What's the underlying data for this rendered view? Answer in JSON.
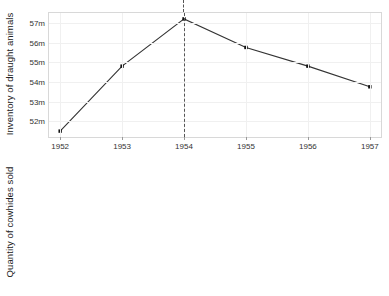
{
  "chart_data": [
    {
      "type": "line",
      "panel": "top",
      "title": "",
      "xlabel": "",
      "ylabel": "Inventory of draught animals",
      "x": [
        1952,
        1953,
        1954,
        1955,
        1956,
        1957
      ],
      "xticklabels": [
        "1952",
        "1953",
        "1954",
        "1955",
        "1956",
        "1957"
      ],
      "values": [
        51.5,
        54.8,
        57.2,
        55.75,
        54.8,
        53.75
      ],
      "yticks": [
        52,
        53,
        54,
        55,
        56,
        57
      ],
      "yticklabels": [
        "52m",
        "53m",
        "54m",
        "55m",
        "56m",
        "57m"
      ],
      "ylim": [
        51.2,
        57.5
      ],
      "xlim": [
        1951.82,
        1957.18
      ],
      "grid": true,
      "legend": false,
      "annotations": [
        {
          "type": "vline",
          "x": 1954,
          "style": "dashed",
          "color": "#555555"
        }
      ]
    },
    {
      "type": "line",
      "panel": "bottom",
      "title": "",
      "xlabel": "",
      "ylabel": "Quantity of cowhides sold",
      "x": [
        1952,
        1953,
        1954,
        1955,
        1956,
        1957
      ],
      "xticklabels": [
        "1952",
        "1953",
        "1954",
        "1955",
        "1956",
        "1957"
      ],
      "values": [
        1.6,
        2.3,
        3.0,
        7.8,
        7.55,
        6.85
      ],
      "yticks": [
        2,
        4,
        6,
        8
      ],
      "yticklabels": [
        "2m",
        "4m",
        "6m",
        "8m"
      ],
      "ylim": [
        1.25,
        8.2
      ],
      "xlim": [
        1951.82,
        1957.18
      ],
      "grid": true,
      "legend": false,
      "annotations": [
        {
          "type": "vline",
          "x": 1954,
          "style": "dashed",
          "color": "#555555"
        }
      ]
    }
  ],
  "colors": {
    "line": "#333333",
    "marker": "#111111",
    "grid": "#f0f0f0",
    "axis_border": "#d8d8d8",
    "annotation": "#555555",
    "background": "#ffffff",
    "text": "#222222"
  }
}
